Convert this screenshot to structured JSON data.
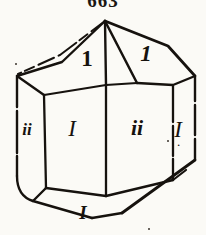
{
  "figure": {
    "number": "663",
    "caption_visible": true
  },
  "colors": {
    "background": "#fbfaf6",
    "ink": "#16120e",
    "ink_soft": "#3a332c"
  },
  "diagram": {
    "type": "crystal-habit-drawing",
    "stroke_width": 2.6,
    "labels": [
      {
        "id": "top-center",
        "text": "1",
        "style": "upright"
      },
      {
        "id": "top-right",
        "text": "1",
        "style": "italic"
      },
      {
        "id": "left-edge",
        "text": "ii",
        "style": "italic"
      },
      {
        "id": "left-face",
        "text": "I",
        "style": "italic"
      },
      {
        "id": "right-face",
        "text": "ii",
        "style": "italic"
      },
      {
        "id": "right-edge",
        "text": "I",
        "style": "italic",
        "trailing": "."
      },
      {
        "id": "bottom",
        "text": "I",
        "style": "italic"
      }
    ]
  }
}
